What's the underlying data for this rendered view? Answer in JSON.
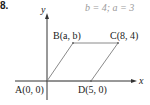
{
  "problem": {
    "number": "8.",
    "given": "b = 4; a = 3"
  },
  "axes": {
    "x_label": "x",
    "y_label": "y"
  },
  "points": {
    "A": {
      "label": "A(0, 0)",
      "name": "A",
      "coords": "(0, 0)"
    },
    "B": {
      "label": "B(a, b)",
      "name": "B",
      "coords": "(a, b)"
    },
    "C": {
      "label": "C(8, 4)",
      "name": "C",
      "coords": "(8, 4)"
    },
    "D": {
      "label": "D(5, 0)",
      "name": "D",
      "coords": "(5, 0)"
    }
  },
  "colors": {
    "shape": "#8a8a8a",
    "axis": "#333333",
    "given_text": "#9a9a9a"
  }
}
